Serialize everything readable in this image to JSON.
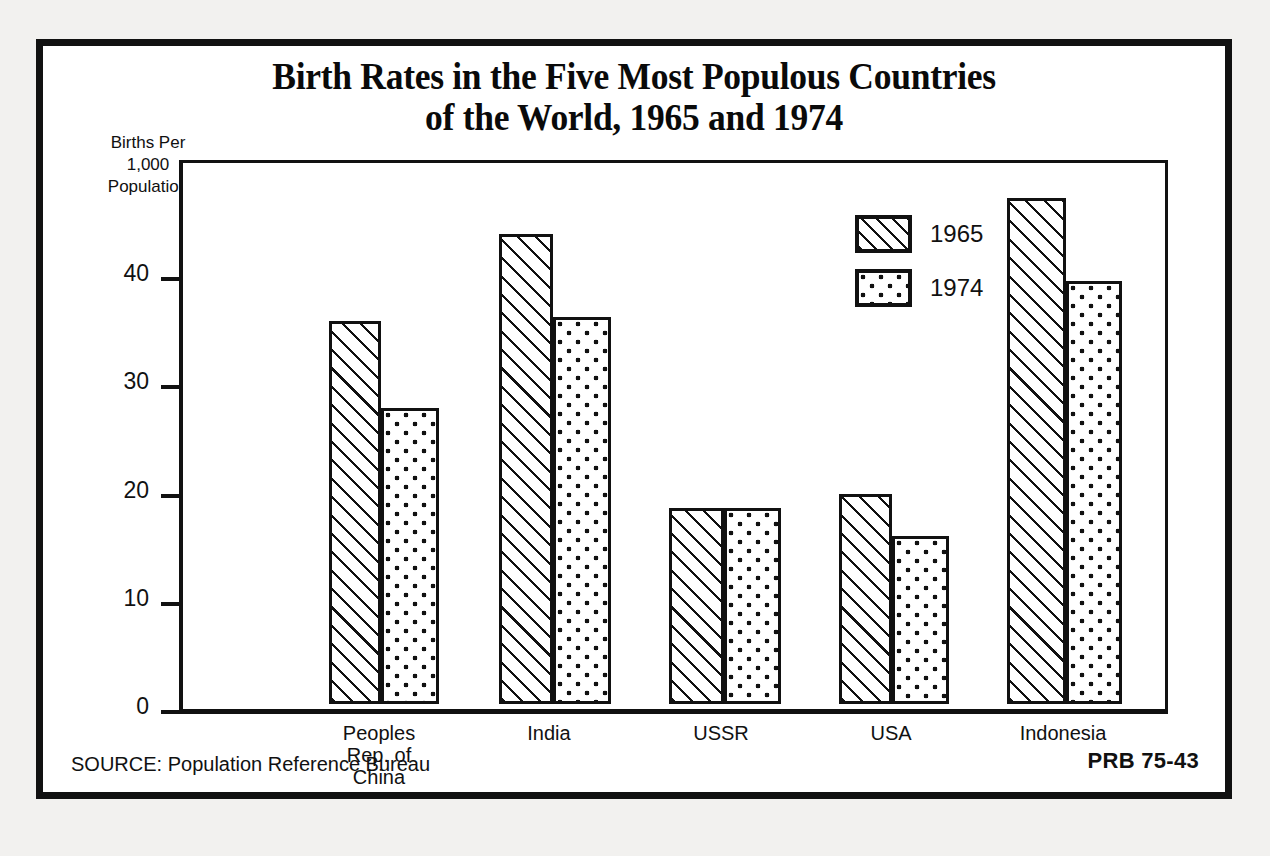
{
  "poster": {
    "title_line_1": "Birth Rates in the Five Most Populous Countries",
    "title_line_2": "of the World, 1965 and 1974",
    "y_caption_line_1": "Births Per",
    "y_caption_line_2": "1,000",
    "y_caption_line_3": "Population",
    "source": "SOURCE: Population Reference Bureau",
    "code": "PRB 75-43"
  },
  "legend": {
    "items": [
      {
        "label": "1965",
        "pattern": "hatch"
      },
      {
        "label": "1974",
        "pattern": "dots"
      }
    ]
  },
  "chart_data": {
    "type": "bar",
    "title": "Birth Rates in the Five Most Populous Countries of the World, 1965 and 1974",
    "xlabel": "",
    "ylabel": "Births Per 1,000 Population",
    "ylim": [
      0,
      50
    ],
    "yticks": [
      0,
      10,
      20,
      30,
      40
    ],
    "ytick_labels": [
      "0",
      "10",
      "20",
      "30",
      "40"
    ],
    "grid": false,
    "legend_position": "inside-top-center",
    "categories": [
      "Peoples\nRep. of\nChina",
      "India",
      "USSR",
      "USA",
      "Indonesia"
    ],
    "category_labels": [
      [
        "Peoples",
        "Rep. of",
        "China"
      ],
      [
        "India"
      ],
      [
        "USSR"
      ],
      [
        "USA"
      ],
      [
        "Indonesia"
      ]
    ],
    "series": [
      {
        "name": "1965",
        "pattern": "hatch",
        "values": [
          35.4,
          43.4,
          18.1,
          19.4,
          46.8
        ]
      },
      {
        "name": "1974",
        "pattern": "dots",
        "values": [
          27.4,
          35.8,
          18.1,
          15.5,
          39.1
        ]
      }
    ],
    "source": "Population Reference Bureau",
    "colors": {
      "ink": "#111111",
      "paper": "#ffffff",
      "page": "#f2f1ef"
    }
  }
}
